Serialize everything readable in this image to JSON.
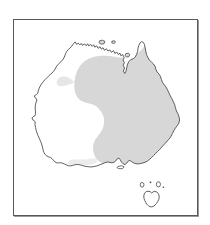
{
  "figure": {
    "type": "distribution-map",
    "region": "Australia",
    "background_color": "#ffffff",
    "frame": {
      "border_color": "#58585a",
      "border_width_px": 1,
      "shadow_color": "#9a9a9c",
      "left_px": 13,
      "top_px": 19,
      "width_px": 185,
      "height_px": 197
    },
    "coastline": {
      "stroke_color": "#4a4a4c",
      "stroke_width_px": 0.9,
      "fill_color": "#ffffff"
    },
    "distribution_shading": {
      "label": "shaded distribution range",
      "fill_color": "#d7d7d7",
      "stroke": "none",
      "coverage_description": "eastern and northern mainland Australia, from the Kimberley/Top End across the Gulf of Carpentaria, Cape York Peninsula, Queensland, New South Wales, Victoria and eastern South Australia",
      "excluded_description": "Western Australia interior, western and southwestern coast, Nullarbor, and Tasmania"
    },
    "islands": [
      {
        "name": "Tasmania",
        "shaded": false
      },
      {
        "name": "King Island",
        "shaded": false
      },
      {
        "name": "Flinders Island",
        "shaded": false
      },
      {
        "name": "Melville Island",
        "shaded": true
      },
      {
        "name": "Groote Eylandt",
        "shaded": true
      },
      {
        "name": "Kangaroo Island",
        "shaded": false
      }
    ],
    "legend": {
      "visible": false,
      "items": []
    },
    "labels": {
      "visible": false,
      "items": []
    },
    "scale_bar": {
      "visible": false
    },
    "north_arrow": {
      "visible": false
    },
    "title": "",
    "caption": ""
  }
}
